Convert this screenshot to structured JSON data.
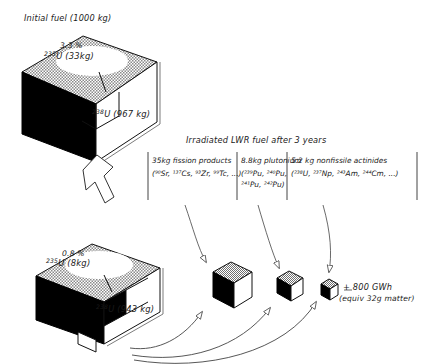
{
  "diagram": {
    "title_initial": "Initial fuel (1000 kg)",
    "title_irradiated": "Irradiated LWR fuel after 3 years",
    "initial_cube": {
      "enrichment_pct": "3.3 %",
      "fissile_label": "U (33kg)",
      "fissile_mass_number": "235",
      "fertile_label": "U (967 kg)",
      "fertile_mass_number": "238"
    },
    "spent_cube": {
      "enrichment_pct": "0.8 %",
      "fissile_label": "U (8kg)",
      "fissile_mass_number": "235",
      "fertile_label": "U (943 kg)",
      "fertile_mass_number": "238"
    },
    "products": [
      {
        "name": "fission-products",
        "heading": "35kg fission products",
        "isotopes": "(⁹⁰Sr, ¹³⁷Cs, ⁹³Zr, ⁹⁹Tc, ...)",
        "isotopes_line2": ""
      },
      {
        "name": "plutonium",
        "heading": "8.8kg plutonium",
        "isotopes": "(²³⁹Pu, ²⁴⁰Pu,",
        "isotopes_line2": "²⁴¹Pu, ²⁴²Pu)"
      },
      {
        "name": "nonfissile-actinides",
        "heading": "5.2 kg nonfissile actinides",
        "isotopes": "(²³⁸U, ²³⁷Np, ²⁴³Am, ²⁴⁴Cm, ...)",
        "isotopes_line2": ""
      }
    ],
    "energy": {
      "amount": "+ 800 GWh",
      "equivalent": "(equiv 32g matter)"
    },
    "colors": {
      "ink": "#1a1a1a",
      "cube_dark_face": "#000000",
      "cube_light_face": "#ffffff",
      "stipple": "#7d7d7d"
    }
  }
}
